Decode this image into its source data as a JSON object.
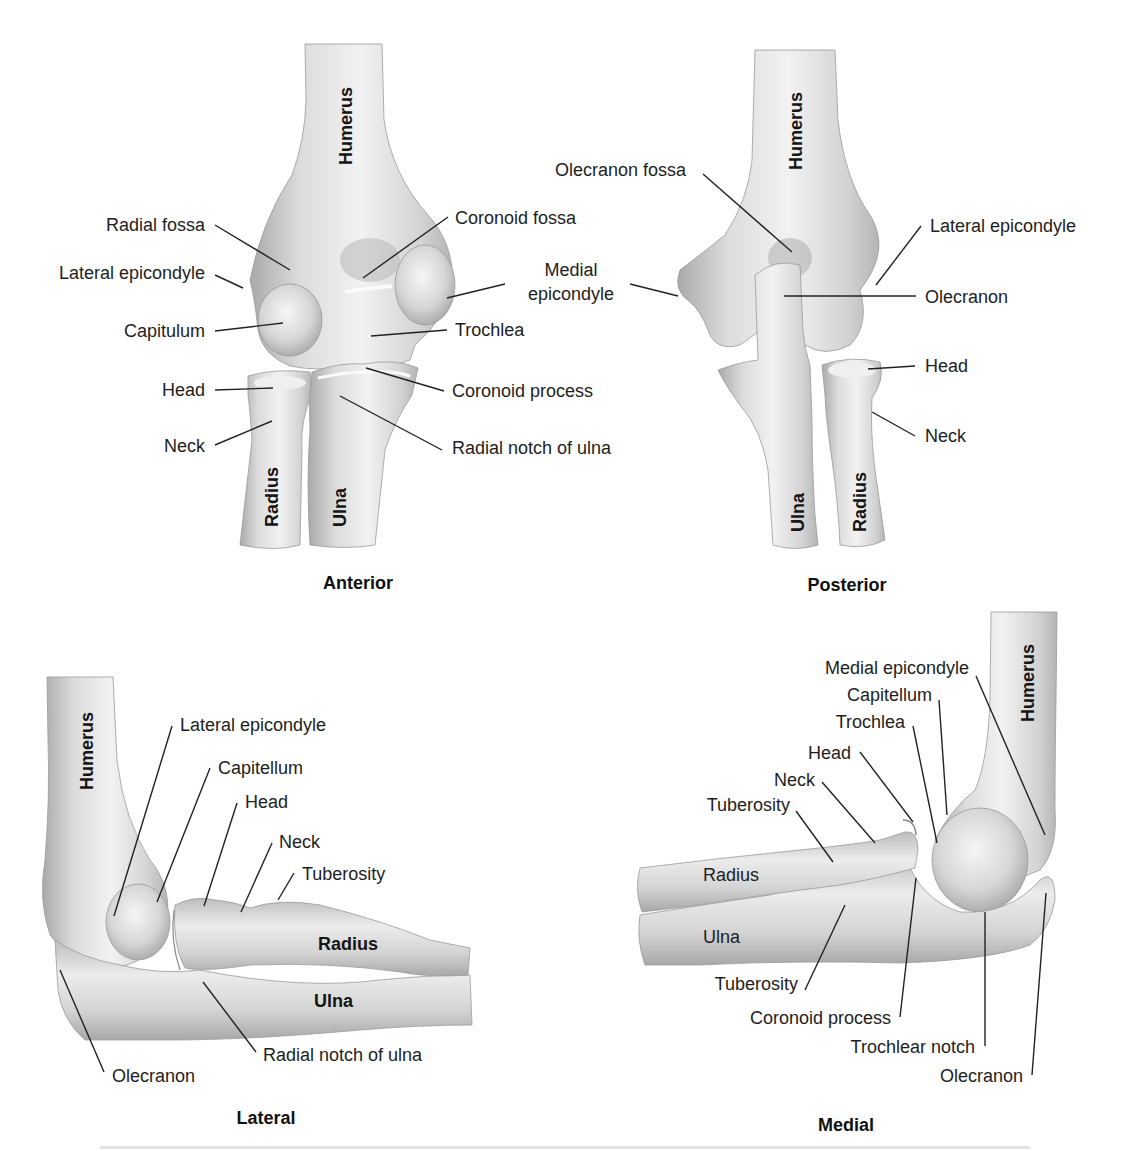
{
  "figure": {
    "views": {
      "anterior": {
        "title": "Anterior",
        "bones": {
          "humerus": "Humerus",
          "radius": "Radius",
          "ulna": "Ulna"
        },
        "labels": {
          "radial_fossa": "Radial fossa",
          "lateral_epicondyle": "Lateral epicondyle",
          "capitulum": "Capitulum",
          "head": "Head",
          "neck": "Neck",
          "coronoid_fossa": "Coronoid fossa",
          "trochlea": "Trochlea",
          "coronoid_process": "Coronoid process",
          "radial_notch_of_ulna": "Radial notch of ulna"
        }
      },
      "posterior": {
        "title": "Posterior",
        "bones": {
          "humerus": "Humerus",
          "radius": "Radius",
          "ulna": "Ulna"
        },
        "labels": {
          "olecranon_fossa": "Olecranon fossa",
          "medial_epicondyle_line1": "Medial",
          "medial_epicondyle_line2": "epicondyle",
          "lateral_epicondyle": "Lateral epicondyle",
          "olecranon": "Olecranon",
          "head": "Head",
          "neck": "Neck"
        }
      },
      "lateral": {
        "title": "Lateral",
        "bones": {
          "humerus": "Humerus",
          "radius": "Radius",
          "ulna": "Ulna"
        },
        "labels": {
          "lateral_epicondyle": "Lateral epicondyle",
          "capitellum": "Capitellum",
          "head": "Head",
          "neck": "Neck",
          "tuberosity": "Tuberosity",
          "radial_notch_of_ulna": "Radial notch of ulna",
          "olecranon": "Olecranon"
        }
      },
      "medial": {
        "title": "Medial",
        "bones": {
          "humerus": "Humerus",
          "radius": "Radius",
          "ulna": "Ulna"
        },
        "labels": {
          "medial_epicondyle": "Medial epicondyle",
          "capitellum": "Capitellum",
          "trochlea": "Trochlea",
          "head": "Head",
          "neck": "Neck",
          "tuberosity_radius": "Tuberosity",
          "tuberosity_ulna": "Tuberosity",
          "coronoid_process": "Coronoid process",
          "trochlear_notch": "Trochlear notch",
          "olecranon": "Olecranon"
        }
      }
    }
  }
}
